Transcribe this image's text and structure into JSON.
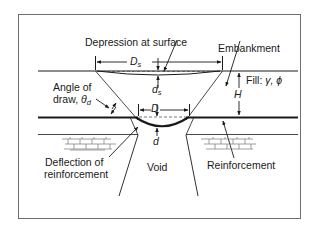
{
  "figure": {
    "type": "geosynthetic-reinforced embankment over void schematic",
    "labels": {
      "depression": "Depression at surface",
      "embankment": "Embankment",
      "fill": "Fill: ",
      "fill_params": "γ, ϕ",
      "angle_line1": "Angle of",
      "angle_line2": "draw, ",
      "angle_symbol": "θ",
      "angle_sub": "d",
      "deflection_line1": "Deflection of",
      "deflection_line2": "reinforcement",
      "void": "Void",
      "reinforcement": "Reinforcement"
    },
    "dimensions": {
      "Ds_symbol": "D",
      "Ds_sub": "s",
      "ds_symbol": "d",
      "ds_sub": "s",
      "D": "D",
      "d": "d",
      "H": "H"
    },
    "colors": {
      "line": "#1a1a1a",
      "frame": "#6e6e6e",
      "brick": "#777777"
    }
  }
}
